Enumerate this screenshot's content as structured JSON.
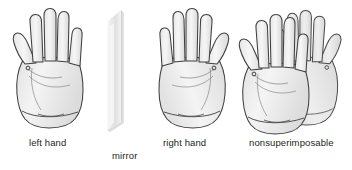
{
  "figure": {
    "background_color": "#ffffff",
    "outline_color": "#3a3a3a",
    "hand_fill_light": "#f2f2f2",
    "hand_fill_shade": "#d2d2d2",
    "mirror_color": "#e8e8e8",
    "text_color": "#231f20"
  },
  "panels": [
    {
      "id": "left-hand",
      "caption": "left hand",
      "icon": "left-hand-palm-illustration"
    },
    {
      "id": "mirror",
      "caption": "mirror",
      "icon": "mirror-plane-illustration"
    },
    {
      "id": "right-hand",
      "caption": "right hand",
      "icon": "right-hand-palm-illustration"
    },
    {
      "id": "nonsuperimposable",
      "caption": "nonsuperimposable",
      "icon": "overlapping-hands-illustration"
    }
  ]
}
